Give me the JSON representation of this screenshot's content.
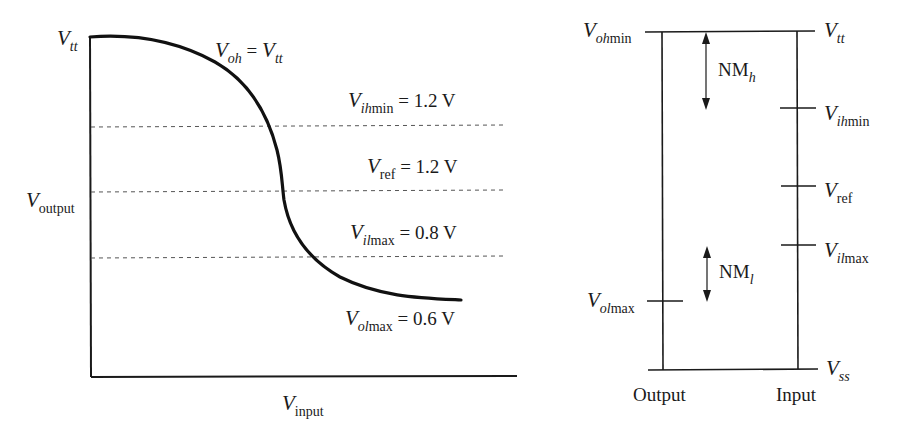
{
  "left_chart": {
    "y_axis_top_label": {
      "main": "V",
      "sub": "tt"
    },
    "y_axis_label": {
      "main": "V",
      "sub": "output"
    },
    "x_axis_label": {
      "main": "V",
      "sub": "input"
    },
    "curve_label": {
      "lhs_main": "V",
      "lhs_sub": "oh",
      "op": "=",
      "rhs_main": "V",
      "rhs_sub": "tt"
    },
    "levels": [
      {
        "name": "Vihmin",
        "main": "V",
        "sub_italic": "ih",
        "sub_plain": "min",
        "value_text": "= 1.2 V"
      },
      {
        "name": "Vref",
        "main": "V",
        "sub_italic": "",
        "sub_plain": "ref",
        "value_text": "= 1.2 V"
      },
      {
        "name": "Vilmax",
        "main": "V",
        "sub_italic": "il",
        "sub_plain": "max",
        "value_text": "= 0.8 V"
      },
      {
        "name": "Volmax",
        "main": "V",
        "sub_italic": "ol",
        "sub_plain": "max",
        "value_text": "= 0.6 V"
      }
    ]
  },
  "right_diagram": {
    "left_top_label": {
      "main": "V",
      "sub_italic": "oh",
      "sub_plain": "min"
    },
    "left_low_label": {
      "main": "V",
      "sub_italic": "ol",
      "sub_plain": "max"
    },
    "right_labels": [
      {
        "name": "Vtt",
        "main": "V",
        "sub_italic": "tt",
        "sub_plain": ""
      },
      {
        "name": "Vihmin",
        "main": "V",
        "sub_italic": "ih",
        "sub_plain": "min"
      },
      {
        "name": "Vref",
        "main": "V",
        "sub_italic": "",
        "sub_plain": "ref"
      },
      {
        "name": "Vilmax",
        "main": "V",
        "sub_italic": "il",
        "sub_plain": "max"
      },
      {
        "name": "Vss",
        "main": "V",
        "sub_italic": "ss",
        "sub_plain": ""
      }
    ],
    "nm_high": {
      "main": "NM",
      "sub": "h"
    },
    "nm_low": {
      "main": "NM",
      "sub": "l"
    },
    "bottom_left": "Output",
    "bottom_right": "Input"
  },
  "colors": {
    "ink": "#1a1a1a",
    "dash": "#555555",
    "background": "#ffffff"
  }
}
